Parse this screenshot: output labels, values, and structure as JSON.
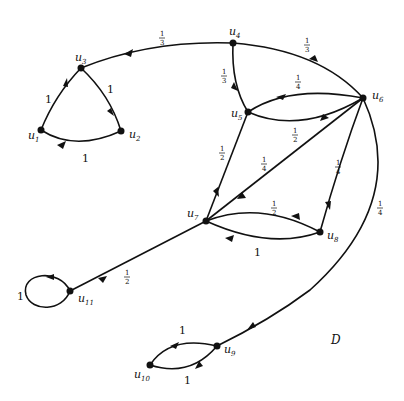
{
  "title": "D",
  "nodes": [
    {
      "id": "u1",
      "label": "u",
      "sub": "1",
      "x": 41,
      "y": 130
    },
    {
      "id": "u2",
      "label": "u",
      "sub": "2",
      "x": 121,
      "y": 131
    },
    {
      "id": "u3",
      "label": "u",
      "sub": "3",
      "x": 81,
      "y": 68
    },
    {
      "id": "u4",
      "label": "u",
      "sub": "4",
      "x": 233,
      "y": 43
    },
    {
      "id": "u5",
      "label": "u",
      "sub": "5",
      "x": 248,
      "y": 112
    },
    {
      "id": "u6",
      "label": "u",
      "sub": "6",
      "x": 363,
      "y": 98
    },
    {
      "id": "u7",
      "label": "u",
      "sub": "7",
      "x": 206,
      "y": 221
    },
    {
      "id": "u8",
      "label": "u",
      "sub": "8",
      "x": 320,
      "y": 232
    },
    {
      "id": "u9",
      "label": "u",
      "sub": "9",
      "x": 217,
      "y": 346
    },
    {
      "id": "u10",
      "label": "u",
      "sub": "10",
      "x": 150,
      "y": 365
    },
    {
      "id": "u11",
      "label": "u",
      "sub": "11",
      "x": 70,
      "y": 291
    }
  ],
  "edges": [
    {
      "from": "u1",
      "to": "u3",
      "weight": "1"
    },
    {
      "from": "u3",
      "to": "u2",
      "weight": "1"
    },
    {
      "from": "u2",
      "to": "u1",
      "weight": "1"
    },
    {
      "from": "u4",
      "to": "u3",
      "weight": "1/3"
    },
    {
      "from": "u4",
      "to": "u6",
      "weight": "1/3"
    },
    {
      "from": "u4",
      "to": "u5",
      "weight": "1/3"
    },
    {
      "from": "u6",
      "to": "u5",
      "weight": "1/4"
    },
    {
      "from": "u5",
      "to": "u6",
      "weight": "1/2"
    },
    {
      "from": "u5",
      "to": "u7",
      "weight": "1/2"
    },
    {
      "from": "u6",
      "to": "u7",
      "weight": "1/4"
    },
    {
      "from": "u6",
      "to": "u8",
      "weight": "1/4"
    },
    {
      "from": "u6",
      "to": "u9",
      "weight": "1/4"
    },
    {
      "from": "u7",
      "to": "u8",
      "weight": "1/2"
    },
    {
      "from": "u8",
      "to": "u7",
      "weight": "1"
    },
    {
      "from": "u7",
      "to": "u11",
      "weight": "1/2"
    },
    {
      "from": "u11",
      "to": "u11",
      "weight": "1"
    },
    {
      "from": "u9",
      "to": "u10",
      "weight": "1"
    },
    {
      "from": "u10",
      "to": "u9",
      "weight": "1"
    }
  ],
  "labels": {
    "u1": {
      "t": "u",
      "s": "1"
    },
    "u2": {
      "t": "u",
      "s": "2"
    },
    "u3": {
      "t": "u",
      "s": "3"
    },
    "u4": {
      "t": "u",
      "s": "4"
    },
    "u5": {
      "t": "u",
      "s": "5"
    },
    "u6": {
      "t": "u",
      "s": "6"
    },
    "u7": {
      "t": "u",
      "s": "7"
    },
    "u8": {
      "t": "u",
      "s": "8"
    },
    "u9": {
      "t": "u",
      "s": "9"
    },
    "u10": {
      "t": "u",
      "s": "10"
    },
    "u11": {
      "t": "u",
      "s": "11"
    }
  },
  "weights": {
    "one": "1",
    "third_num": "1",
    "third_den": "3",
    "quarter_num": "1",
    "quarter_den": "4",
    "half_num": "1",
    "half_den": "2"
  }
}
